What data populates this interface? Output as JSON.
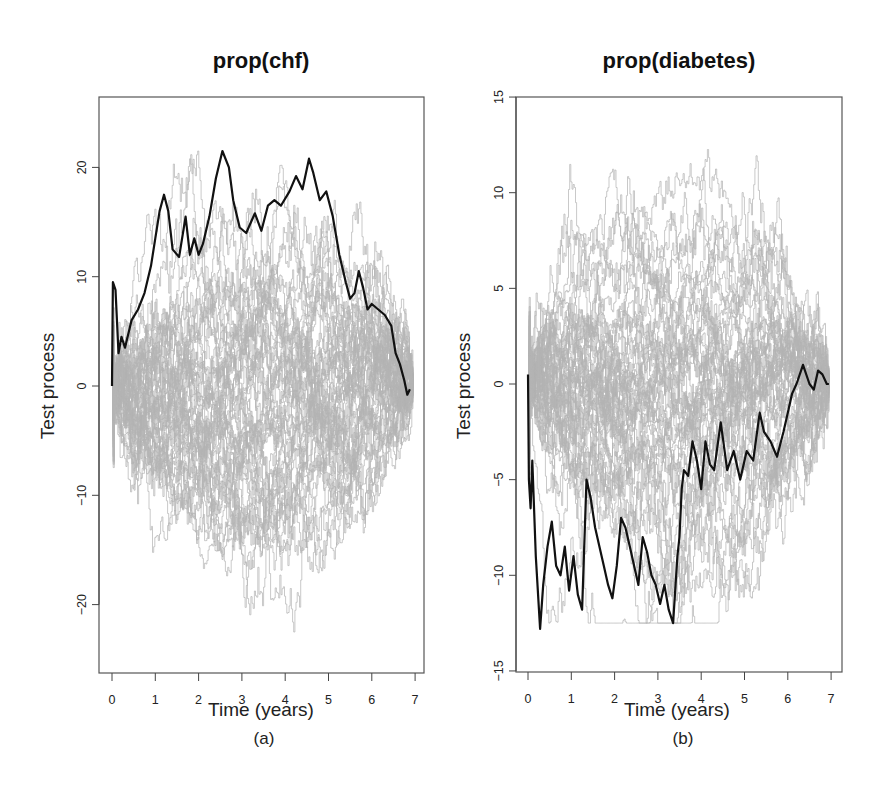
{
  "chart_data": [
    {
      "type": "line",
      "panel": "(a)",
      "title": "prop(chf)",
      "xlabel": "Time (years)",
      "ylabel": "Test process",
      "xlim": [
        -0.3,
        7.2
      ],
      "ylim": [
        -26,
        26
      ],
      "xticks": [
        0,
        1,
        2,
        3,
        4,
        5,
        6,
        7
      ],
      "yticks": [
        -20,
        -10,
        0,
        10,
        20
      ],
      "grid": false,
      "legend": null,
      "series": [
        {
          "name": "observed",
          "color": "#111111",
          "x": [
            0.0,
            0.02,
            0.08,
            0.15,
            0.22,
            0.3,
            0.45,
            0.6,
            0.75,
            0.9,
            1.0,
            1.1,
            1.2,
            1.3,
            1.4,
            1.55,
            1.7,
            1.8,
            1.9,
            2.0,
            2.1,
            2.25,
            2.4,
            2.55,
            2.7,
            2.8,
            2.95,
            3.1,
            3.3,
            3.45,
            3.6,
            3.75,
            3.9,
            4.1,
            4.25,
            4.4,
            4.55,
            4.65,
            4.8,
            4.95,
            5.1,
            5.25,
            5.4,
            5.5,
            5.6,
            5.7,
            5.8,
            5.9,
            6.0,
            6.15,
            6.3,
            6.45,
            6.55,
            6.65,
            6.75,
            6.82,
            6.88
          ],
          "y": [
            0.0,
            9.5,
            8.8,
            3.0,
            4.5,
            3.5,
            6.0,
            7.0,
            8.5,
            11.0,
            13.5,
            16.0,
            17.5,
            16.0,
            12.5,
            11.8,
            15.5,
            12.0,
            13.5,
            12.0,
            13.0,
            15.5,
            19.0,
            21.5,
            20.0,
            17.0,
            14.5,
            14.0,
            15.8,
            14.2,
            16.5,
            17.0,
            16.5,
            17.8,
            19.2,
            18.0,
            20.8,
            19.5,
            17.0,
            17.8,
            15.5,
            12.0,
            9.5,
            8.0,
            8.5,
            10.5,
            9.0,
            7.0,
            7.5,
            7.0,
            6.5,
            5.5,
            3.0,
            2.0,
            0.5,
            -0.8,
            -0.3
          ]
        },
        {
          "name": "simulated realizations (gray, ~50 paths)",
          "color": "#b4b4b4",
          "envelope": {
            "max_approx": 21.5,
            "min_approx": -24.5,
            "start": 0,
            "end": 0
          }
        }
      ]
    },
    {
      "type": "line",
      "panel": "(b)",
      "title": "prop(diabetes)",
      "xlabel": "Time (years)",
      "ylabel": "Test process",
      "xlim": [
        -0.3,
        7.2
      ],
      "ylim": [
        -15,
        15
      ],
      "xticks": [
        0,
        1,
        2,
        3,
        4,
        5,
        6,
        7
      ],
      "yticks": [
        -15,
        -10,
        -5,
        0,
        5,
        10,
        15
      ],
      "grid": false,
      "legend": null,
      "series": [
        {
          "name": "observed",
          "color": "#111111",
          "x": [
            0.0,
            0.02,
            0.06,
            0.1,
            0.18,
            0.28,
            0.35,
            0.45,
            0.55,
            0.65,
            0.75,
            0.85,
            0.95,
            1.05,
            1.15,
            1.25,
            1.35,
            1.45,
            1.55,
            1.65,
            1.75,
            1.85,
            1.95,
            2.05,
            2.15,
            2.25,
            2.35,
            2.45,
            2.55,
            2.65,
            2.75,
            2.85,
            2.95,
            3.05,
            3.15,
            3.25,
            3.35,
            3.45,
            3.5,
            3.55,
            3.6,
            3.7,
            3.8,
            3.9,
            4.0,
            4.1,
            4.2,
            4.3,
            4.45,
            4.6,
            4.75,
            4.9,
            5.05,
            5.2,
            5.35,
            5.45,
            5.6,
            5.75,
            5.9,
            6.0,
            6.1,
            6.2,
            6.35,
            6.5,
            6.6,
            6.7,
            6.8,
            6.9,
            6.95
          ],
          "y": [
            0.5,
            -5.0,
            -6.5,
            -4.0,
            -9.0,
            -12.8,
            -10.5,
            -8.5,
            -7.2,
            -9.5,
            -10.0,
            -8.5,
            -10.8,
            -9.0,
            -11.0,
            -11.8,
            -5.0,
            -6.0,
            -7.5,
            -8.5,
            -9.5,
            -10.5,
            -11.2,
            -9.5,
            -7.0,
            -7.5,
            -8.5,
            -9.5,
            -10.5,
            -8.0,
            -8.8,
            -10.0,
            -10.5,
            -11.5,
            -10.5,
            -11.8,
            -12.5,
            -9.0,
            -8.0,
            -5.5,
            -4.5,
            -4.8,
            -3.0,
            -4.0,
            -5.5,
            -3.0,
            -4.2,
            -4.5,
            -2.0,
            -4.5,
            -3.5,
            -5.0,
            -3.5,
            -4.0,
            -1.5,
            -2.5,
            -3.0,
            -3.8,
            -2.5,
            -1.5,
            -0.5,
            0.0,
            1.0,
            0.0,
            -0.3,
            0.7,
            0.5,
            0.0,
            0.0
          ]
        },
        {
          "name": "simulated realizations (gray, ~50 paths)",
          "color": "#b4b4b4",
          "envelope": {
            "max_approx": 14.0,
            "min_approx": -12.5,
            "start": 0,
            "end": 0
          }
        }
      ]
    }
  ],
  "figure": {
    "panels": [
      {
        "id": "a",
        "title": "prop(chf)",
        "xlabel": "Time (years)",
        "ylabel": "Test process",
        "caption": "(a)",
        "xtick_labels": [
          "0",
          "1",
          "2",
          "3",
          "4",
          "5",
          "6",
          "7"
        ],
        "ytick_labels": [
          "-20",
          "-10",
          "0",
          "10",
          "20"
        ]
      },
      {
        "id": "b",
        "title": "prop(diabetes)",
        "xlabel": "Time (years)",
        "ylabel": "Test process",
        "caption": "(b)",
        "xtick_labels": [
          "0",
          "1",
          "2",
          "3",
          "4",
          "5",
          "6",
          "7"
        ],
        "ytick_labels": [
          "-15",
          "-10",
          "-5",
          "0",
          "5",
          "10",
          "15"
        ]
      }
    ],
    "colors": {
      "observed": "#111111",
      "simulated": "#b4b4b4",
      "frame": "#555555",
      "text": "#222222"
    }
  }
}
